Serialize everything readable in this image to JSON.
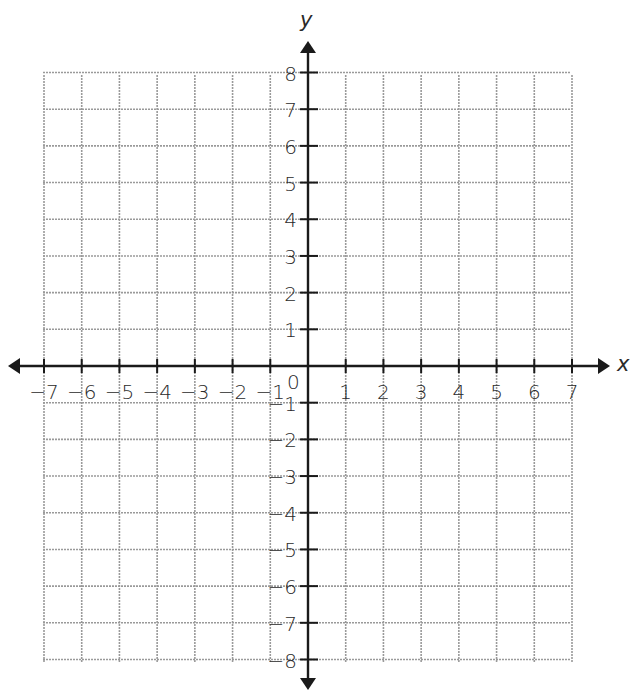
{
  "diagram": {
    "type": "coordinate-plane",
    "x_axis": {
      "label": "x",
      "min": -7,
      "max": 7,
      "tick_labels": [
        "-7",
        "-6",
        "-5",
        "-4",
        "-3",
        "-2",
        "-1",
        "1",
        "2",
        "3",
        "4",
        "5",
        "6",
        "7"
      ]
    },
    "y_axis": {
      "label": "y",
      "min": -8,
      "max": 8,
      "tick_labels": [
        "8",
        "7",
        "6",
        "5",
        "4",
        "3",
        "2",
        "1",
        "-1",
        "-2",
        "-3",
        "-4",
        "-5",
        "-6",
        "-7",
        "-8"
      ]
    },
    "origin_label": "0",
    "grid": {
      "on": true,
      "color": "#9a9a9a"
    },
    "axis_color": "#1a1a1a"
  },
  "chart_data": {
    "type": "scatter",
    "title": "",
    "xlabel": "x",
    "ylabel": "y",
    "xlim": [
      -7,
      7
    ],
    "ylim": [
      -8,
      8
    ],
    "grid": true,
    "x_ticks": [
      -7,
      -6,
      -5,
      -4,
      -3,
      -2,
      -1,
      0,
      1,
      2,
      3,
      4,
      5,
      6,
      7
    ],
    "y_ticks": [
      -8,
      -7,
      -6,
      -5,
      -4,
      -3,
      -2,
      -1,
      0,
      1,
      2,
      3,
      4,
      5,
      6,
      7,
      8
    ],
    "series": []
  }
}
